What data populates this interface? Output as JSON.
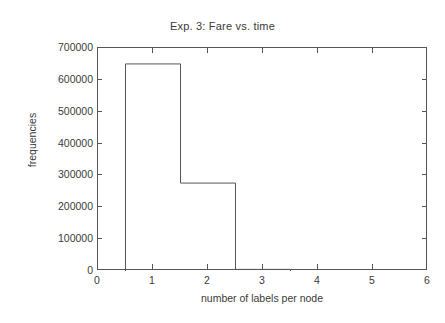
{
  "chart_data": {
    "type": "bar",
    "title": "Exp. 3: Fare vs. time",
    "xlabel": "number of labels per node",
    "ylabel": "frequencies",
    "xlim": [
      0,
      6
    ],
    "ylim": [
      0,
      700000
    ],
    "grid": false,
    "legend": null,
    "bin_width": 1,
    "bin_edges": [
      0.5,
      1.5,
      2.5,
      3.5
    ],
    "categories": [
      "1",
      "2",
      "3"
    ],
    "values": [
      650000,
      276000,
      5000
    ],
    "xticks": [
      "0",
      "1",
      "2",
      "3",
      "4",
      "5",
      "6"
    ],
    "xtick_values": [
      0,
      1,
      2,
      3,
      4,
      5,
      6
    ],
    "yticks": [
      "0",
      "100000",
      "200000",
      "300000",
      "400000",
      "500000",
      "600000",
      "700000"
    ],
    "ytick_values": [
      0,
      100000,
      200000,
      300000,
      400000,
      500000,
      600000,
      700000
    ],
    "style": {
      "line_color": "#555555",
      "fill": "none",
      "background": "#ffffff",
      "text_color": "#3a3a3a"
    }
  }
}
